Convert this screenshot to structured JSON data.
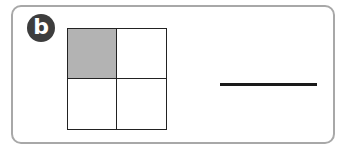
{
  "badge": {
    "label": "b",
    "color": "#3d3d3d"
  },
  "grid": {
    "rows": 2,
    "cols": 2,
    "cells": [
      {
        "shaded": true
      },
      {
        "shaded": false
      },
      {
        "shaded": false
      },
      {
        "shaded": false
      }
    ],
    "shade_color": "#b3b3b3"
  },
  "answer": {
    "value": ""
  }
}
